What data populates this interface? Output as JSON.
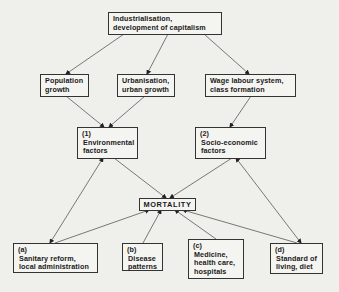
{
  "diagram": {
    "nodes": {
      "industrialisation": {
        "lines": [
          "Industrialisation,",
          "development of capitalism"
        ]
      },
      "population": {
        "lines": [
          "Population",
          "growth"
        ]
      },
      "urbanisation": {
        "lines": [
          "Urbanisation,",
          "urban growth"
        ]
      },
      "wage": {
        "lines": [
          "Wage labour system,",
          "class formation"
        ]
      },
      "environmental": {
        "num": "(1)",
        "lines": [
          "Environmental",
          "factors"
        ]
      },
      "socioeconomic": {
        "num": "(2)",
        "lines": [
          "Socio-economic",
          "factors"
        ]
      },
      "mortality": {
        "label": "MORTALITY"
      },
      "sanitary": {
        "num": "(a)",
        "lines": [
          "Sanitary reform,",
          "local administration"
        ]
      },
      "disease": {
        "num": "(b)",
        "lines": [
          "Disease",
          "patterns"
        ]
      },
      "medicine": {
        "num": "(c)",
        "lines": [
          "Medicine,",
          "health care,",
          "hospitals"
        ]
      },
      "standard": {
        "num": "(d)",
        "lines": [
          "Standard of",
          "living, diet"
        ]
      }
    },
    "edges": [
      {
        "from": "industrialisation",
        "to": "population",
        "type": "one-way"
      },
      {
        "from": "industrialisation",
        "to": "urbanisation",
        "type": "one-way"
      },
      {
        "from": "industrialisation",
        "to": "wage",
        "type": "one-way"
      },
      {
        "from": "population",
        "to": "environmental",
        "type": "one-way"
      },
      {
        "from": "urbanisation",
        "to": "environmental",
        "type": "one-way"
      },
      {
        "from": "wage",
        "to": "socioeconomic",
        "type": "one-way"
      },
      {
        "from": "environmental",
        "to": "mortality",
        "type": "one-way"
      },
      {
        "from": "socioeconomic",
        "to": "mortality",
        "type": "one-way"
      },
      {
        "from": "environmental",
        "to": "sanitary",
        "type": "two-way"
      },
      {
        "from": "socioeconomic",
        "to": "standard",
        "type": "two-way"
      },
      {
        "from": "sanitary",
        "to": "mortality",
        "type": "one-way"
      },
      {
        "from": "disease",
        "to": "mortality",
        "type": "one-way"
      },
      {
        "from": "medicine",
        "to": "mortality",
        "type": "one-way"
      },
      {
        "from": "standard",
        "to": "mortality",
        "type": "one-way"
      }
    ],
    "colors": {
      "background": "#efefeb",
      "line": "#333333",
      "text": "#1a1a1a"
    }
  }
}
